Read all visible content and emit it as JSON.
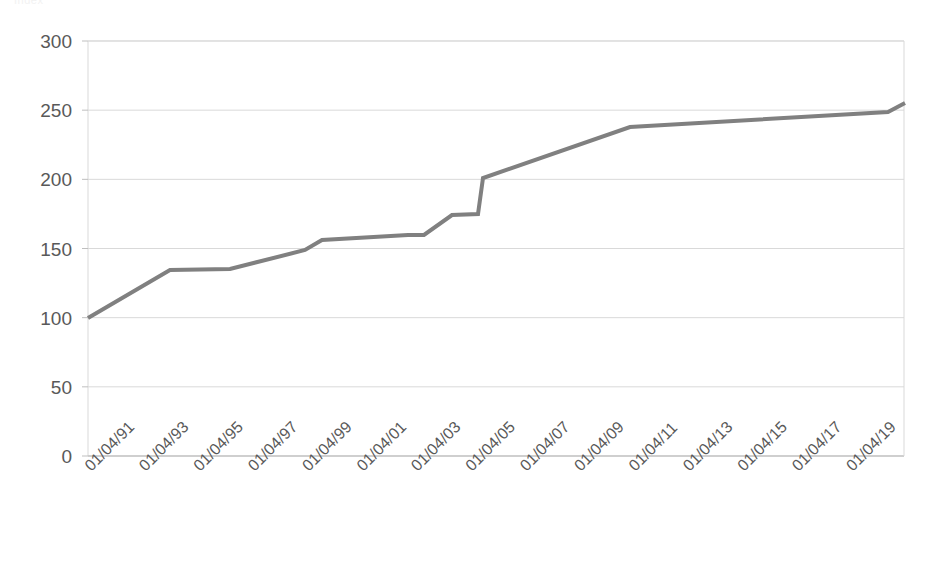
{
  "chart_data": {
    "type": "line",
    "title": "",
    "subtitle": "",
    "xlabel": "",
    "ylabel": "",
    "ylim": [
      0,
      300
    ],
    "yticks": [
      0,
      50,
      100,
      150,
      200,
      250,
      300
    ],
    "ytick_labels": [
      "0",
      "50",
      "100",
      "150",
      "200",
      "250",
      "300"
    ],
    "grid": true,
    "grid_axis": "y",
    "legend": false,
    "legend_position": "none",
    "line_color": "#808080",
    "line_width": 4,
    "xtick_labels": [
      "01/04/91",
      "01/04/93",
      "01/04/95",
      "01/04/97",
      "01/04/99",
      "01/04/01",
      "01/04/03",
      "01/04/05",
      "01/04/07",
      "01/04/09",
      "01/04/11",
      "01/04/13",
      "01/04/15",
      "01/04/17",
      "01/04/19"
    ],
    "xtick_rotation_deg": -45,
    "x": [
      "01/04/91",
      "01/04/92",
      "01/04/93",
      "01/04/94",
      "01/04/95",
      "01/04/96",
      "01/04/97",
      "01/04/98",
      "01/04/98b",
      "01/04/99",
      "01/04/99b",
      "01/04/00",
      "01/04/01",
      "01/04/02",
      "01/04/03",
      "01/04/03b",
      "01/04/04",
      "01/04/05",
      "01/04/05b",
      "01/04/06",
      "01/04/09",
      "01/04/11",
      "01/04/13",
      "01/04/15",
      "01/04/17",
      "01/04/19",
      "01/04/19b"
    ],
    "series": [
      {
        "name": "Index",
        "values": [
          100,
          112,
          122,
          130,
          130,
          131,
          134,
          138,
          141,
          141,
          156,
          157,
          158,
          160,
          161,
          161,
          176,
          177,
          178,
          202,
          236,
          237,
          240,
          243,
          245,
          247,
          255
        ]
      }
    ],
    "points_px": [
      [
        88,
        318
      ],
      [
        170,
        270
      ],
      [
        230,
        269
      ],
      [
        305,
        250
      ],
      [
        322,
        240
      ],
      [
        408,
        235
      ],
      [
        424,
        235
      ],
      [
        452,
        215
      ],
      [
        478,
        214
      ],
      [
        483,
        178
      ],
      [
        630,
        127
      ],
      [
        888,
        112
      ],
      [
        905,
        103
      ]
    ],
    "plot_area_px": {
      "left": 88,
      "right": 904,
      "top": 41,
      "bottom": 456
    },
    "annotations": []
  },
  "axes": {
    "y_axis_name": "value-axis",
    "x_axis_name": "date-axis"
  },
  "clipped_header": {
    "text": "Index"
  }
}
